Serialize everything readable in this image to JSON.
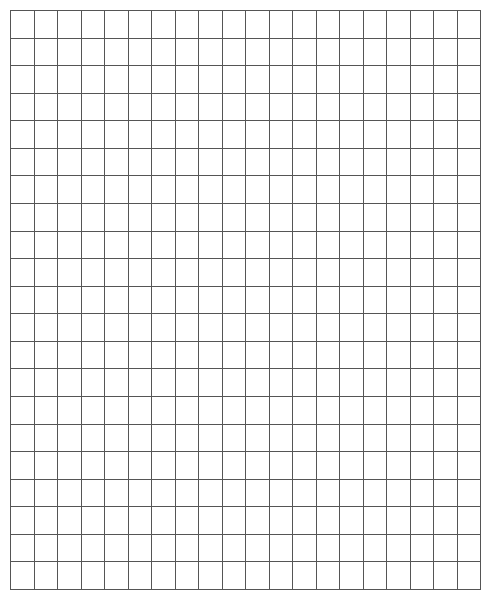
{
  "grid": {
    "columns": 20,
    "rows": 21,
    "origin_x": 10,
    "origin_y": 10,
    "width": 470,
    "height": 579,
    "line_color": "#555555",
    "background_color": "#ffffff"
  }
}
